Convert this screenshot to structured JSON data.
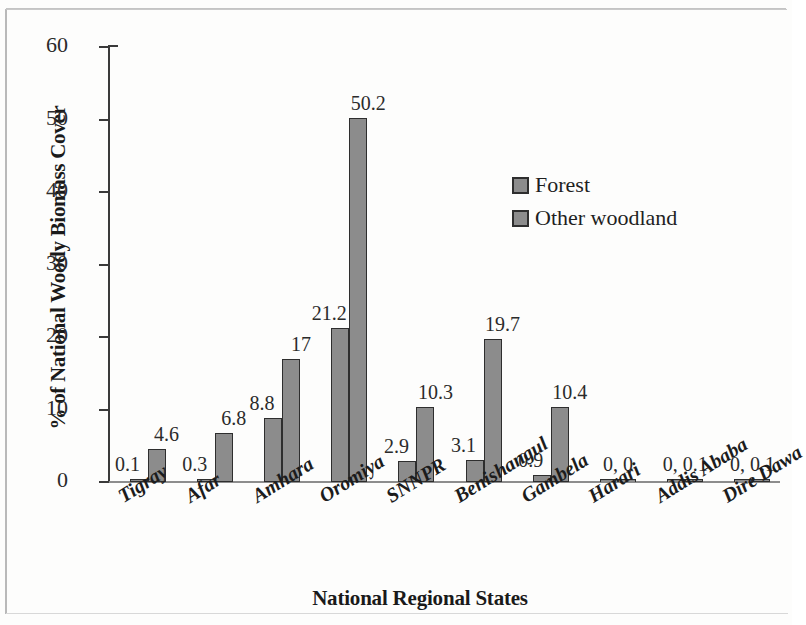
{
  "chart_data": {
    "type": "bar",
    "title": "",
    "xlabel": "National Regional States",
    "ylabel": "% of National Woody Biomass Cover",
    "ylim": [
      0,
      60
    ],
    "yticks": [
      0,
      10,
      20,
      30,
      40,
      50,
      60
    ],
    "ytick_labels": [
      "0",
      "10",
      "20",
      "30",
      "40",
      "50",
      "60"
    ],
    "grid": false,
    "legend_position": "upper right",
    "categories": [
      "Tigray",
      "Afar",
      "Amhara",
      "Oromiya",
      "SNNPR",
      "Benishangul",
      "Gambela",
      "Harari",
      "Addis Ababa",
      "Dire Dawa"
    ],
    "series": [
      {
        "name": "Forest",
        "color": "#8c8c8c",
        "values": [
          0.1,
          0.3,
          8.8,
          21.2,
          2.9,
          3.1,
          0.9,
          0,
          0,
          0
        ]
      },
      {
        "name": "Other woodland",
        "color": "#8c8c8c",
        "values": [
          4.6,
          6.8,
          17,
          50.2,
          10.3,
          19.7,
          10.4,
          0,
          0.1,
          0.1
        ]
      }
    ],
    "data_labels": [
      {
        "category": "Tigray",
        "forest": "0.1",
        "other": "4.6",
        "combined": null
      },
      {
        "category": "Afar",
        "forest": "0.3",
        "other": "6.8",
        "combined": null
      },
      {
        "category": "Amhara",
        "forest": "8.8",
        "other": "17",
        "combined": null
      },
      {
        "category": "Oromiya",
        "forest": "21.2",
        "other": "50.2",
        "combined": null
      },
      {
        "category": "SNNPR",
        "forest": "2.9",
        "other": "10.3",
        "combined": null
      },
      {
        "category": "Benishangul",
        "forest": "3.1",
        "other": "19.7",
        "combined": null
      },
      {
        "category": "Gambela",
        "forest": "0.9",
        "other": "10.4",
        "combined": null
      },
      {
        "category": "Harari",
        "forest": null,
        "other": null,
        "combined": "0, 0"
      },
      {
        "category": "Addis Ababa",
        "forest": null,
        "other": null,
        "combined": "0, 0.1"
      },
      {
        "category": "Dire Dawa",
        "forest": null,
        "other": null,
        "combined": "0, 0.1"
      }
    ]
  },
  "legend": {
    "items": [
      {
        "label": "Forest"
      },
      {
        "label": "Other woodland"
      }
    ]
  }
}
